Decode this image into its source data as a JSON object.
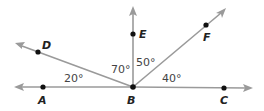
{
  "diagram": {
    "vertex": {
      "name": "B",
      "x": 133,
      "y": 87
    },
    "rays": [
      {
        "id": "BA",
        "point": "A",
        "px": 43,
        "py": 87,
        "tx": 16,
        "ty": 87
      },
      {
        "id": "BD",
        "point": "D",
        "px": 38,
        "py": 52,
        "tx": 18,
        "ty": 44
      },
      {
        "id": "BE",
        "point": "E",
        "px": 133,
        "py": 34,
        "tx": 133,
        "ty": 8
      },
      {
        "id": "BF",
        "point": "F",
        "px": 206,
        "py": 25,
        "tx": 224,
        "ty": 10
      },
      {
        "id": "BC",
        "point": "C",
        "px": 224,
        "py": 88,
        "tx": 251,
        "ty": 88
      }
    ],
    "labels": {
      "A": "A",
      "B": "B",
      "C": "C",
      "D": "D",
      "E": "E",
      "F": "F"
    },
    "angles": {
      "ABD": "20°",
      "DBE": "70°",
      "EBF": "50°",
      "FBC": "40°"
    },
    "colors": {
      "ray": "#9a9a9a",
      "point": "#111111",
      "label": "#222222",
      "angle_text": "#444444"
    }
  }
}
